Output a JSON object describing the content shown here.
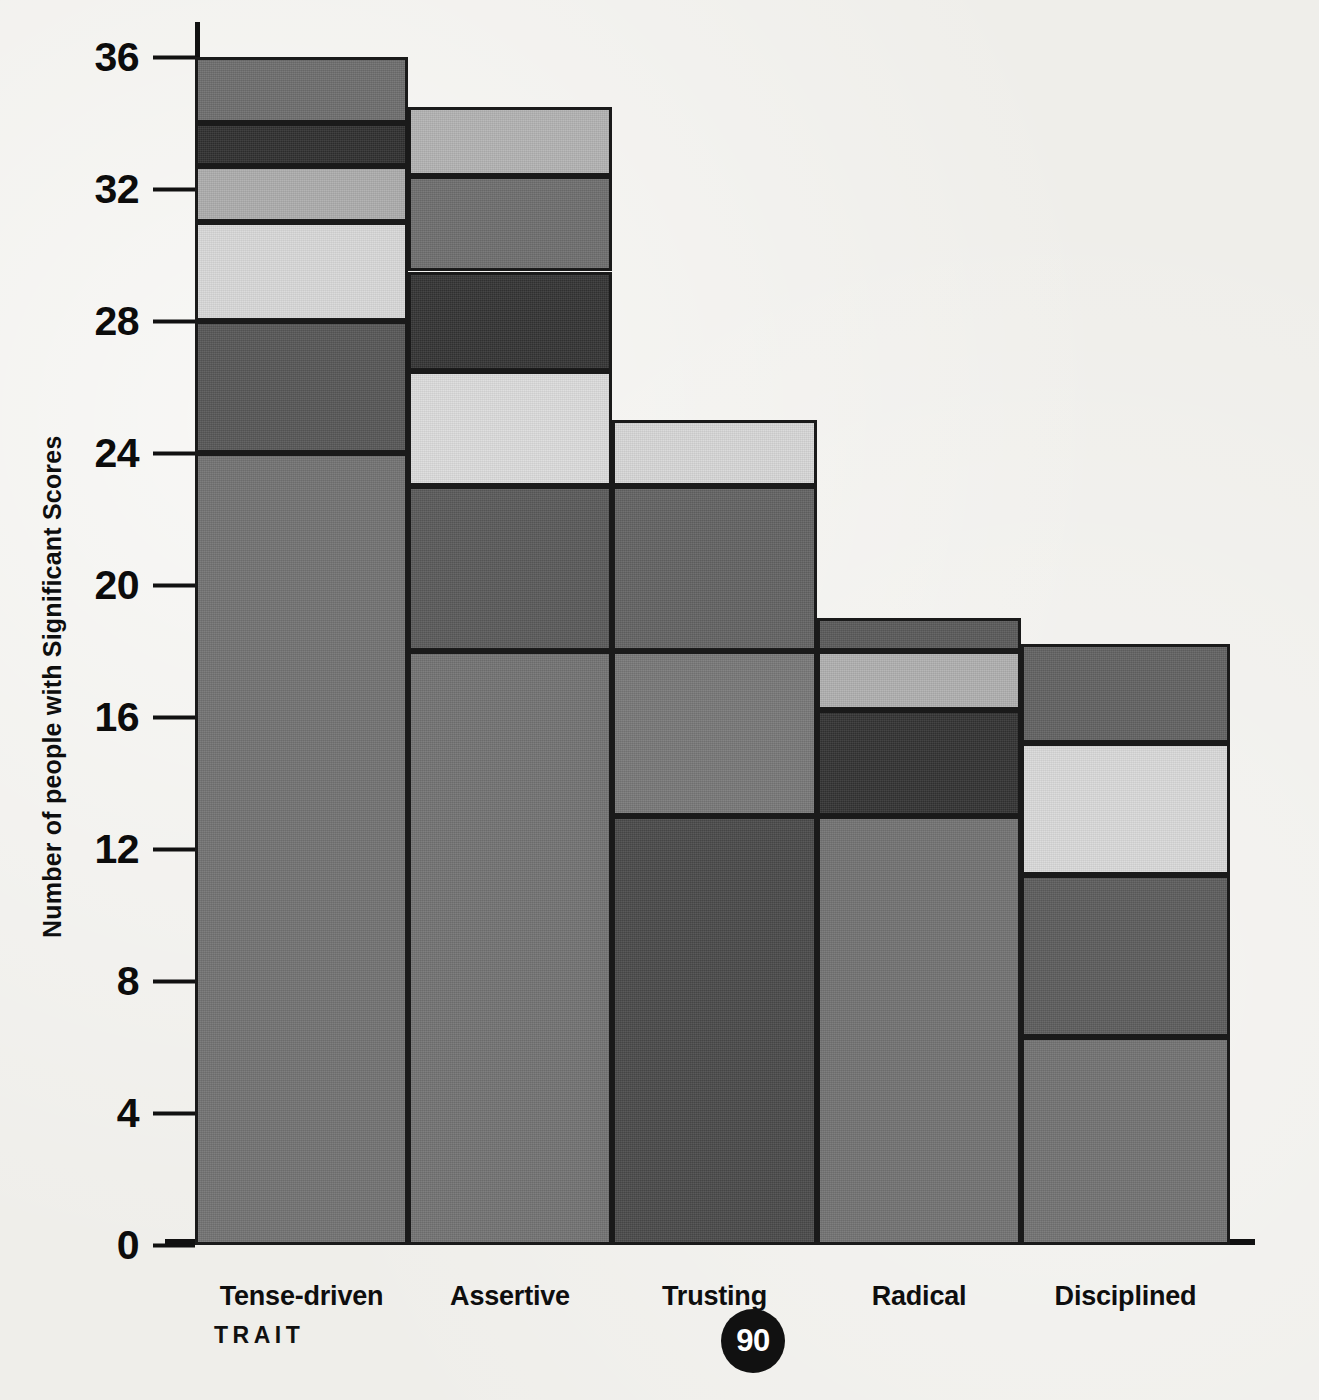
{
  "chart_data": {
    "type": "bar",
    "title": "",
    "subtype": "stacked-bar",
    "xlabel": "TRAIT",
    "ylabel": "Number of people with Significant Scores",
    "ylim": [
      0,
      36
    ],
    "yticks": [
      0,
      4,
      8,
      12,
      16,
      20,
      24,
      28,
      32,
      36
    ],
    "ytick_labels": [
      "0",
      "4",
      "8",
      "12",
      "16",
      "20",
      "24",
      "28",
      "32",
      "36"
    ],
    "grid": false,
    "legend": "none",
    "categories": [
      "Tense-driven",
      "Assertive",
      "Trusting",
      "Radical",
      "Disciplined"
    ],
    "totals": [
      36,
      34.5,
      25,
      19,
      18.2
    ],
    "bars": [
      {
        "category": "Tense-driven",
        "total": 36,
        "segments": [
          {
            "from": 0,
            "to": 24,
            "value": 24,
            "color": "#737373"
          },
          {
            "from": 24,
            "to": 28,
            "value": 4,
            "color": "#575757"
          },
          {
            "from": 28,
            "to": 31,
            "value": 3,
            "color": "#d9d9d9"
          },
          {
            "from": 31,
            "to": 32.7,
            "value": 1.7,
            "color": "#adadad"
          },
          {
            "from": 32.7,
            "to": 34,
            "value": 1.3,
            "color": "#303030"
          },
          {
            "from": 34,
            "to": 36,
            "value": 2,
            "color": "#6e6e6e"
          }
        ]
      },
      {
        "category": "Assertive",
        "total": 34.5,
        "segments": [
          {
            "from": 0,
            "to": 18,
            "value": 18,
            "color": "#737373"
          },
          {
            "from": 18,
            "to": 23,
            "value": 5,
            "color": "#5a5a5a"
          },
          {
            "from": 23,
            "to": 26.5,
            "value": 3.5,
            "color": "#dcdcdc"
          },
          {
            "from": 26.5,
            "to": 29.5,
            "value": 3,
            "color": "#343434"
          },
          {
            "from": 29.5,
            "to": 32.4,
            "value": 2.9,
            "color": "#6e6e6e"
          },
          {
            "from": 32.4,
            "to": 34.5,
            "value": 2.1,
            "color": "#b3b3b3"
          }
        ]
      },
      {
        "category": "Trusting",
        "total": 25,
        "segments": [
          {
            "from": 0,
            "to": 13,
            "value": 13,
            "color": "#4a4a4a"
          },
          {
            "from": 13,
            "to": 18,
            "value": 5,
            "color": "#787878"
          },
          {
            "from": 18,
            "to": 23,
            "value": 5,
            "color": "#636363"
          },
          {
            "from": 23,
            "to": 25,
            "value": 2,
            "color": "#d7d7d7"
          }
        ]
      },
      {
        "category": "Radical",
        "total": 19,
        "segments": [
          {
            "from": 0,
            "to": 13,
            "value": 13,
            "color": "#737373"
          },
          {
            "from": 13,
            "to": 16.2,
            "value": 3.2,
            "color": "#333333"
          },
          {
            "from": 16.2,
            "to": 18,
            "value": 1.8,
            "color": "#b0b0b0"
          },
          {
            "from": 18,
            "to": 19,
            "value": 1,
            "color": "#5a5a5a"
          }
        ]
      },
      {
        "category": "Disciplined",
        "total": 18.2,
        "segments": [
          {
            "from": 0,
            "to": 6.3,
            "value": 6.3,
            "color": "#737373"
          },
          {
            "from": 6.3,
            "to": 11.2,
            "value": 4.9,
            "color": "#5d5d5d"
          },
          {
            "from": 11.2,
            "to": 15.2,
            "value": 4,
            "color": "#dadada"
          },
          {
            "from": 15.2,
            "to": 18.2,
            "value": 3,
            "color": "#626262"
          }
        ]
      }
    ]
  },
  "axis": {
    "y_title": "Number of people with Significant Scores",
    "x_title": "TRAIT",
    "ticks": [
      {
        "label": "36",
        "value": 36
      },
      {
        "label": "32",
        "value": 32
      },
      {
        "label": "28",
        "value": 28
      },
      {
        "label": "24",
        "value": 24
      },
      {
        "label": "20",
        "value": 20
      },
      {
        "label": "16",
        "value": 16
      },
      {
        "label": "12",
        "value": 12
      },
      {
        "label": "8",
        "value": 8
      },
      {
        "label": "4",
        "value": 4
      },
      {
        "label": "0",
        "value": 0
      }
    ]
  },
  "categories": [
    {
      "label": "Tense-driven"
    },
    {
      "label": "Assertive"
    },
    {
      "label": "Trusting"
    },
    {
      "label": "Radical"
    },
    {
      "label": "Disciplined"
    }
  ],
  "page": {
    "number": "90"
  }
}
